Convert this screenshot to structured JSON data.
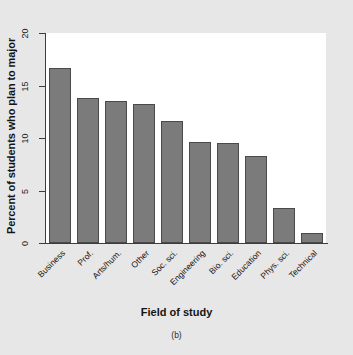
{
  "chart_data": {
    "type": "bar",
    "title": "",
    "subtitle": "",
    "xlabel": "Field of study",
    "ylabel": "Percent of students who plan to major",
    "categories": [
      "Business",
      "Prof.",
      "Arts/hum.",
      "Other",
      "Soc. sci.",
      "Engineering",
      "Bio. sci.",
      "Education",
      "Phys. sci.",
      "Technical"
    ],
    "values": [
      16.7,
      13.8,
      13.5,
      13.2,
      11.6,
      9.6,
      9.5,
      8.3,
      3.3,
      1.0
    ],
    "ylim": [
      0,
      20
    ],
    "yticks": [
      0,
      5,
      10,
      15,
      20
    ],
    "ytick_labels": [
      "0",
      "5",
      "10",
      "15",
      "20"
    ],
    "grid": false,
    "legend": null,
    "legend_position": "none",
    "bar_color": "#7b7b7b",
    "bar_edge_color": "#4a4a4a",
    "plot_background": "#ffffff",
    "figure_background": "#e7e7e7",
    "axis_color": "#3c3c3c",
    "panel_caption": "(b)"
  }
}
